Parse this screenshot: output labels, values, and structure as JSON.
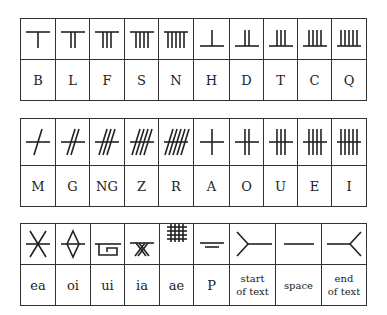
{
  "tables": [
    {
      "name": "aicme-beithe-and-huatha",
      "cells": [
        {
          "glyph": "b-glyph",
          "label": "B"
        },
        {
          "glyph": "l-glyph",
          "label": "L"
        },
        {
          "glyph": "f-glyph",
          "label": "F"
        },
        {
          "glyph": "s-glyph",
          "label": "S"
        },
        {
          "glyph": "n-glyph",
          "label": "N"
        },
        {
          "glyph": "h-glyph",
          "label": "H"
        },
        {
          "glyph": "d-glyph",
          "label": "D"
        },
        {
          "glyph": "t-glyph",
          "label": "T"
        },
        {
          "glyph": "c-glyph",
          "label": "C"
        },
        {
          "glyph": "q-glyph",
          "label": "Q"
        }
      ]
    },
    {
      "name": "aicme-muine-and-ailme",
      "cells": [
        {
          "glyph": "m-glyph",
          "label": "M"
        },
        {
          "glyph": "g-glyph",
          "label": "G"
        },
        {
          "glyph": "ng-glyph",
          "label": "NG"
        },
        {
          "glyph": "z-glyph",
          "label": "Z"
        },
        {
          "glyph": "r-glyph",
          "label": "R"
        },
        {
          "glyph": "a-glyph",
          "label": "A"
        },
        {
          "glyph": "o-glyph",
          "label": "O"
        },
        {
          "glyph": "u-glyph",
          "label": "U"
        },
        {
          "glyph": "e-glyph",
          "label": "E"
        },
        {
          "glyph": "i-glyph",
          "label": "I"
        }
      ]
    },
    {
      "name": "forfeda-and-punctuation",
      "cells": [
        {
          "glyph": "ea-glyph",
          "label": "ea"
        },
        {
          "glyph": "oi-glyph",
          "label": "oi"
        },
        {
          "glyph": "ui-glyph",
          "label": "ui"
        },
        {
          "glyph": "ia-glyph",
          "label": "ia"
        },
        {
          "glyph": "ae-glyph",
          "label": "ae"
        },
        {
          "glyph": "p-glyph",
          "label": "P"
        },
        {
          "glyph": "start-of-text-glyph",
          "label_line1": "start",
          "label_line2": "of text"
        },
        {
          "glyph": "space-glyph",
          "label": "space"
        },
        {
          "glyph": "end-of-text-glyph",
          "label_line1": "end",
          "label_line2": "of text"
        }
      ]
    }
  ]
}
